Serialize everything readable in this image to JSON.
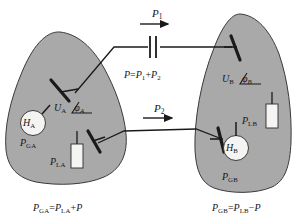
{
  "figure": {
    "type": "power-system-interconnection-diagram",
    "background_color": "#ffffff",
    "area_fill_color": "#a9a9a9",
    "area_stroke_color": "#3a3a3a",
    "line_color": "#1a1a1a",
    "symbol_fill_color": "#f4f4f2"
  },
  "areas": {
    "left": {
      "name": "Area A",
      "bus_label": {
        "voltage": "U",
        "voltage_sub": "A",
        "angle": "φ",
        "angle_sub": "A"
      },
      "generator": {
        "symbol": "H",
        "symbol_sub": "A",
        "power_label": "P",
        "power_sub": "GA"
      },
      "load": {
        "power_label": "P",
        "power_sub": "LA"
      }
    },
    "right": {
      "name": "Area B",
      "bus_label": {
        "voltage": "U",
        "voltage_sub": "B",
        "angle": "φ",
        "angle_sub": "B"
      },
      "generator": {
        "symbol": "H",
        "symbol_sub": "B",
        "power_label": "P",
        "power_sub": "GB"
      },
      "load": {
        "power_label": "P",
        "power_sub": "LB"
      }
    }
  },
  "tie_lines": {
    "upper": {
      "flow_label": "P",
      "flow_sub": "1",
      "has_series_capacitor": true,
      "direction": "left-to-right"
    },
    "lower": {
      "flow_label": "P",
      "flow_sub": "2",
      "has_series_capacitor": false,
      "direction": "left-to-right"
    }
  },
  "equations": {
    "center": {
      "lhs": "P",
      "rhs_term1": "P",
      "rhs_term1_sub": "1",
      "operator": "+",
      "rhs_term2": "P",
      "rhs_term2_sub": "2"
    },
    "bottom_left": {
      "lhs": "P",
      "lhs_sub": "GA",
      "rhs_term1": "P",
      "rhs_term1_sub": "LA",
      "operator": "+",
      "rhs_term2": "P"
    },
    "bottom_right": {
      "lhs": "P",
      "lhs_sub": "GB",
      "rhs_term1": "P",
      "rhs_term1_sub": "LB",
      "operator": "−",
      "rhs_term2": "P"
    }
  }
}
